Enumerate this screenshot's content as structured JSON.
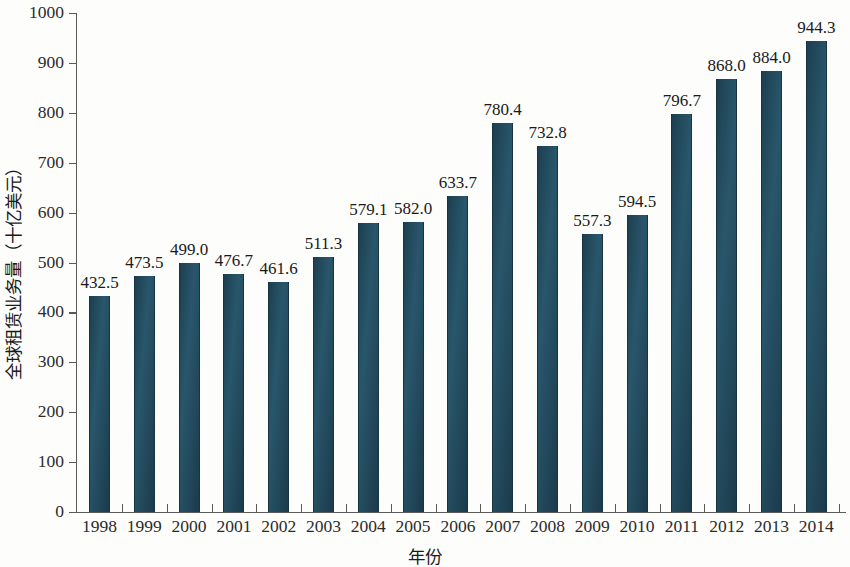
{
  "chart_data": {
    "type": "bar",
    "title": "",
    "subtitle": "",
    "xlabel": "年份",
    "ylabel": "全球租赁业务量（十亿美元）",
    "categories": [
      "1998",
      "1999",
      "2000",
      "2001",
      "2002",
      "2003",
      "2004",
      "2005",
      "2006",
      "2007",
      "2008",
      "2009",
      "2010",
      "2011",
      "2012",
      "2013",
      "2014"
    ],
    "values": [
      432.5,
      473.5,
      499.0,
      476.7,
      461.6,
      511.3,
      579.1,
      582.0,
      633.7,
      780.4,
      732.8,
      557.3,
      594.5,
      796.7,
      868.0,
      884.0,
      944.3
    ],
    "value_labels": [
      "432.5",
      "473.5",
      "499.0",
      "476.7",
      "461.6",
      "511.3",
      "579.1",
      "582.0",
      "633.7",
      "780.4",
      "732.8",
      "557.3",
      "594.5",
      "796.7",
      "868.0",
      "884.0",
      "944.3"
    ],
    "ylim": [
      0,
      1000
    ],
    "ytick_values": [
      0,
      100,
      200,
      300,
      400,
      500,
      600,
      700,
      800,
      900,
      1000
    ],
    "ytick_labels": [
      "0",
      "100",
      "200",
      "300",
      "400",
      "500",
      "600",
      "700",
      "800",
      "900",
      "1000"
    ],
    "grid": false,
    "legend": null,
    "series": [
      {
        "name": "全球租赁业务量",
        "color": "#1f4354",
        "values": [
          432.5,
          473.5,
          499.0,
          476.7,
          461.6,
          511.3,
          579.1,
          582.0,
          633.7,
          780.4,
          732.8,
          557.3,
          594.5,
          796.7,
          868.0,
          884.0,
          944.3
        ]
      }
    ],
    "colors": {
      "bar": "#1f4354",
      "axis": "#5a5a5a",
      "text": "#1a1a1a",
      "background": "#fdfdfc"
    }
  }
}
